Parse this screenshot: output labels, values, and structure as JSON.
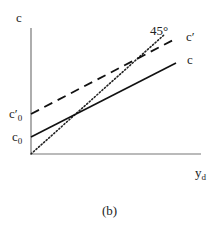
{
  "figure": {
    "caption": "(b)",
    "y_axis_label": "c",
    "x_axis_label": {
      "main": "y",
      "sub": "d"
    },
    "intercepts": [
      {
        "id": "c_prime_0",
        "main": "c′",
        "sub": "0"
      },
      {
        "id": "c_0",
        "main": "c",
        "sub": "0"
      }
    ],
    "lines": [
      {
        "id": "c",
        "label": "c",
        "style": "solid",
        "color": "#111111"
      },
      {
        "id": "c_prime",
        "label": "c′",
        "style": "dashed",
        "color": "#111111"
      },
      {
        "id": "forty_five",
        "label": "45°",
        "style": "dotted",
        "color": "#111111"
      }
    ]
  }
}
